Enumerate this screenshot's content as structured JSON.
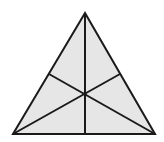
{
  "diagram": {
    "type": "triangle-with-medians",
    "fill_color": "#e6e6e6",
    "stroke_color": "#1a1a1a",
    "stroke_width": 2,
    "vertices": {
      "apex": [
        85,
        13
      ],
      "bottom_left": [
        13,
        134
      ],
      "bottom_right": [
        155,
        134
      ]
    },
    "midpoints": {
      "left_side": [
        49,
        74
      ],
      "right_side": [
        120,
        74
      ],
      "base": [
        85,
        134
      ]
    },
    "centroid": [
      85,
      94
    ]
  }
}
